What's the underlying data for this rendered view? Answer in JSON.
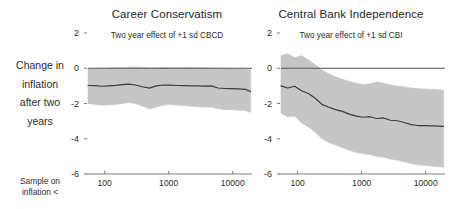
{
  "axis_label": {
    "lines": [
      "Change in",
      "inflation",
      "after two",
      "years"
    ]
  },
  "sample_note": {
    "lines": [
      "Sample on",
      "inflation <"
    ]
  },
  "colors": {
    "band": "#c6c6c6",
    "line": "#3a3a3a",
    "axis": "#6e6e6e",
    "text": "#2b2b2b"
  },
  "chart_data": {
    "type": "line",
    "xlabel": "",
    "ylabel": "Change in inflation after two years",
    "xscale": "log",
    "xlim": [
      55,
      20000
    ],
    "ylim": [
      -6,
      2
    ],
    "yticks": [
      2,
      0,
      -2,
      -4,
      -6
    ],
    "ytick_labels": [
      "2",
      "0",
      "-2",
      "-4",
      "-6"
    ],
    "xticks": [
      100,
      1000,
      10000
    ],
    "xtick_labels": [
      "100",
      "1000",
      "10000"
    ],
    "grid": false,
    "legend": "none",
    "annotations": [
      "Zero reference line drawn at y = 0 in both panels"
    ],
    "panels": [
      {
        "title": "Career Conservatism",
        "subtitle": "Two year effect of +1 sd CBCD",
        "x": [
          55,
          70,
          90,
          115,
          150,
          190,
          240,
          300,
          390,
          500,
          640,
          820,
          1050,
          1350,
          1700,
          2200,
          2800,
          3600,
          4600,
          5900,
          7500,
          9600,
          12300,
          15800,
          19000
        ],
        "estimate": [
          -0.98,
          -0.99,
          -1.02,
          -1.0,
          -0.97,
          -0.93,
          -0.9,
          -0.95,
          -1.05,
          -1.13,
          -1.0,
          -0.95,
          -0.96,
          -0.98,
          -0.99,
          -1.0,
          -1.0,
          -1.01,
          -1.0,
          -1.12,
          -1.15,
          -1.16,
          -1.17,
          -1.2,
          -1.32
        ],
        "ci_upper": [
          -0.02,
          -0.03,
          0.0,
          0.02,
          0.05,
          0.04,
          0.06,
          0.07,
          0.05,
          0.02,
          0.03,
          0.05,
          0.04,
          0.03,
          0.04,
          0.05,
          0.04,
          0.03,
          0.02,
          0.0,
          -0.01,
          -0.02,
          -0.03,
          -0.05,
          -0.08
        ],
        "ci_lower": [
          -2.0,
          -2.05,
          -2.1,
          -2.08,
          -2.05,
          -2.0,
          -1.95,
          -2.0,
          -2.15,
          -2.3,
          -2.2,
          -2.1,
          -2.05,
          -2.1,
          -2.12,
          -2.15,
          -2.18,
          -2.2,
          -2.2,
          -2.3,
          -2.35,
          -2.35,
          -2.38,
          -2.4,
          -2.5
        ]
      },
      {
        "title": "Central Bank Independence",
        "subtitle": "Two year effect of +1 sd CBI",
        "x": [
          55,
          70,
          90,
          115,
          150,
          190,
          240,
          300,
          390,
          500,
          640,
          820,
          1050,
          1350,
          1700,
          2200,
          2800,
          3600,
          4600,
          5900,
          7500,
          9600,
          12300,
          15800,
          19000
        ],
        "estimate": [
          -1.0,
          -1.12,
          -1.02,
          -1.28,
          -1.45,
          -1.72,
          -2.05,
          -2.2,
          -2.35,
          -2.45,
          -2.6,
          -2.72,
          -2.78,
          -2.75,
          -2.85,
          -2.82,
          -2.95,
          -2.98,
          -3.08,
          -3.2,
          -3.25,
          -3.26,
          -3.27,
          -3.28,
          -3.3
        ],
        "ci_upper": [
          0.72,
          0.82,
          0.6,
          0.72,
          0.45,
          0.2,
          -0.1,
          -0.3,
          -0.48,
          -0.62,
          -0.75,
          -0.85,
          -0.92,
          -0.88,
          -0.78,
          -0.85,
          -0.95,
          -1.0,
          -1.05,
          -1.12,
          -1.15,
          -1.18,
          -1.2,
          -1.22,
          -1.25
        ],
        "ci_lower": [
          -2.55,
          -2.75,
          -2.72,
          -3.1,
          -3.35,
          -3.65,
          -4.0,
          -4.2,
          -4.35,
          -4.5,
          -4.65,
          -4.78,
          -4.85,
          -4.9,
          -5.0,
          -5.05,
          -5.15,
          -5.22,
          -5.3,
          -5.4,
          -5.48,
          -5.52,
          -5.55,
          -5.58,
          -5.62
        ]
      }
    ]
  }
}
